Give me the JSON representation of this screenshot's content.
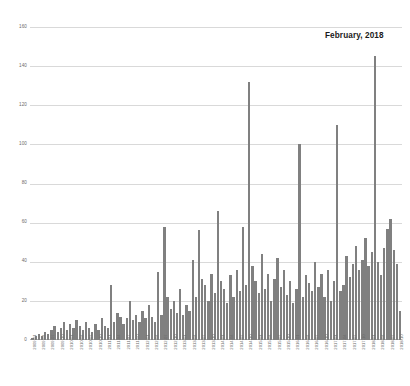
{
  "chart_data": {
    "type": "bar",
    "title": "",
    "subtitle": "",
    "xlabel": "",
    "ylabel": "",
    "ylim": [
      0,
      160
    ],
    "yticks": [
      0,
      20,
      40,
      60,
      80,
      100,
      120,
      140,
      160
    ],
    "grid": true,
    "legend": null,
    "bar_color": "#808080",
    "gridline_color": "#d9d9d9",
    "tick_label_color": "#6b6b6b",
    "annotations": [
      {
        "text": "February, 2018",
        "points_to_category": "2018-02",
        "value": 145
      }
    ],
    "categories": [
      "2009-01",
      "2009-02",
      "2009-03",
      "2009-04",
      "2009-05",
      "2009-06",
      "2009-07",
      "2009-08",
      "2009-09",
      "2009-10",
      "2009-11",
      "2009-12",
      "2010-01",
      "2010-02",
      "2010-03",
      "2010-04",
      "2010-05",
      "2010-06",
      "2010-07",
      "2010-08",
      "2010-09",
      "2010-10",
      "2010-11",
      "2010-12",
      "2011-01",
      "2011-02",
      "2011-03",
      "2011-04",
      "2011-05",
      "2011-06",
      "2011-07",
      "2011-08",
      "2011-09",
      "2011-10",
      "2011-11",
      "2011-12",
      "2012-01",
      "2012-02",
      "2012-03",
      "2012-04",
      "2012-05",
      "2012-06",
      "2012-07",
      "2012-08",
      "2012-09",
      "2012-10",
      "2012-11",
      "2012-12",
      "2013-01",
      "2013-02",
      "2013-03",
      "2013-04",
      "2013-05",
      "2013-06",
      "2013-07",
      "2013-08",
      "2013-09",
      "2013-10",
      "2013-11",
      "2013-12",
      "2014-01",
      "2014-02",
      "2014-03",
      "2014-04",
      "2014-05",
      "2014-06",
      "2014-07",
      "2014-08",
      "2014-09",
      "2014-10",
      "2014-11",
      "2014-12",
      "2015-01",
      "2015-02",
      "2015-03",
      "2015-04",
      "2015-05",
      "2015-06",
      "2015-07",
      "2015-08",
      "2015-09",
      "2015-10",
      "2015-11",
      "2015-12",
      "2016-01",
      "2016-02",
      "2016-03",
      "2016-04",
      "2016-05",
      "2016-06",
      "2016-07",
      "2016-08",
      "2016-09",
      "2016-10",
      "2016-11",
      "2016-12",
      "2017-01",
      "2017-02",
      "2017-03",
      "2017-04",
      "2017-05",
      "2017-06",
      "2017-07",
      "2017-08",
      "2017-09",
      "2017-10",
      "2017-11",
      "2017-12",
      "2018-01",
      "2018-02",
      "2018-03",
      "2018-04",
      "2018-05",
      "2018-06",
      "2018-07",
      "2018-08",
      "2018-09",
      "2018-10"
    ],
    "tick_labels_shown": [
      "2009-01",
      "2009-04",
      "2009-07",
      "2009-10",
      "2010-01",
      "2010-04",
      "2010-07",
      "2010-10",
      "2011-01",
      "2011-04",
      "2011-07",
      "2011-10",
      "2012-01",
      "2012-04",
      "2012-07",
      "2012-10",
      "2013-01",
      "2013-04",
      "2013-07",
      "2013-10",
      "2014-01",
      "2014-04",
      "2014-07",
      "2014-10",
      "2015-01",
      "2015-04",
      "2015-07",
      "2015-10",
      "2016-01",
      "2016-04",
      "2016-07",
      "2016-10",
      "2017-01",
      "2017-04",
      "2017-07",
      "2017-10",
      "2018-01",
      "2018-04",
      "2018-07",
      "2018-10"
    ],
    "values": [
      1,
      2,
      3,
      2,
      4,
      3,
      5,
      7,
      4,
      6,
      9,
      5,
      8,
      6,
      10,
      7,
      5,
      9,
      6,
      4,
      8,
      5,
      11,
      7,
      6,
      28,
      9,
      14,
      12,
      8,
      11,
      20,
      10,
      13,
      9,
      15,
      11,
      18,
      12,
      9,
      35,
      13,
      58,
      22,
      16,
      20,
      14,
      26,
      13,
      18,
      15,
      41,
      22,
      56,
      31,
      28,
      20,
      34,
      24,
      66,
      30,
      26,
      19,
      33,
      22,
      36,
      25,
      58,
      28,
      132,
      38,
      30,
      24,
      44,
      26,
      34,
      20,
      31,
      42,
      27,
      36,
      23,
      30,
      19,
      26,
      100,
      22,
      33,
      29,
      25,
      40,
      27,
      34,
      22,
      36,
      20,
      30,
      110,
      25,
      28,
      43,
      32,
      39,
      48,
      36,
      41,
      52,
      38,
      45,
      145,
      40,
      33,
      47,
      57,
      62,
      46,
      39,
      15
    ]
  }
}
